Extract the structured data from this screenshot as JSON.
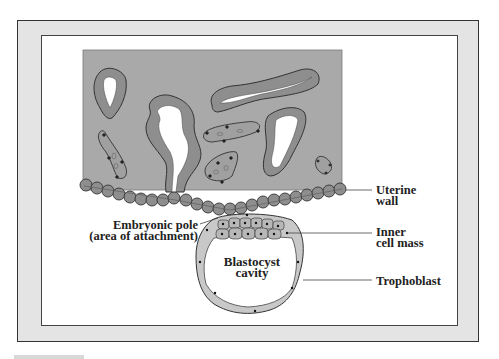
{
  "figure": {
    "type": "anatomical-diagram",
    "labels": {
      "uterine_wall": [
        "Uterine",
        "wall"
      ],
      "embryonic_pole": [
        "Embryonic pole",
        "(area of attachment)"
      ],
      "inner_cell_mass": [
        "Inner",
        "cell mass"
      ],
      "blastocyst_cavity": [
        "Blastocyst",
        "cavity"
      ],
      "trophoblast": [
        "Trophoblast"
      ]
    },
    "colors": {
      "frame_band": "#e4e4e4",
      "frame_border": "#333333",
      "tissue_fill": "#a9a9a9",
      "cell_fill": "#8e8e8e",
      "cell_outline": "#3a3a3a",
      "gland_lumen": "#ffffff",
      "inner_cell_fill": "#b7b7b7",
      "trophoblast_fill": "#c8c8c8",
      "nucleus": "#111111"
    }
  }
}
